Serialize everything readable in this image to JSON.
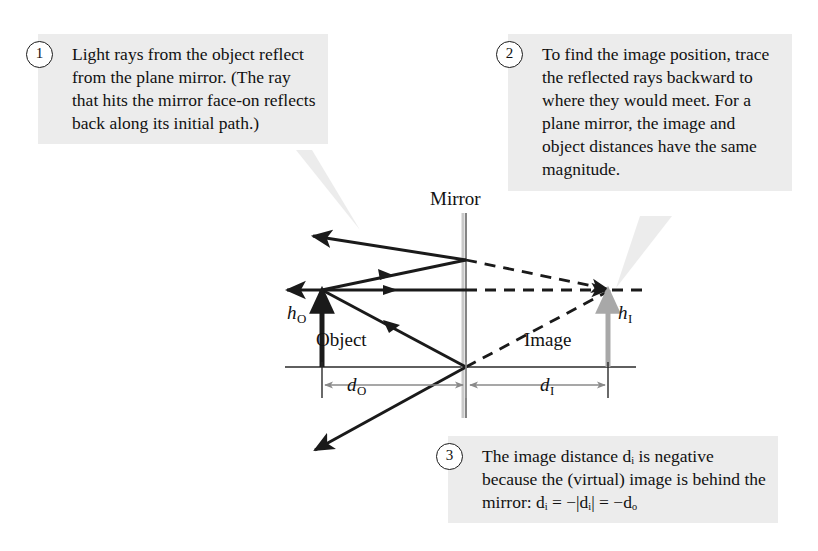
{
  "figure": {
    "title_label": "Mirror",
    "object_label": "Object",
    "image_label": "Image"
  },
  "callouts": [
    {
      "number": "1",
      "text": "Light rays from the object reflect from the plane mirror. (The ray that hits the mirror face-on reflects back along its initial path.)"
    },
    {
      "number": "2",
      "text": "To find the image position, trace the reflected rays backward to where they would meet. For a plane mirror, the image and object distances have the same magnitude."
    },
    {
      "number": "3",
      "text": "The image distance dᵢ is negative because the (virtual) image is behind the mirror: dᵢ = −|dᵢ| = −dₒ"
    }
  ],
  "symbols": {
    "h_object": "h",
    "h_object_sub": "O",
    "h_image": "h",
    "h_image_sub": "I",
    "d_object": "d",
    "d_object_sub": "O",
    "d_image": "d",
    "d_image_sub": "I"
  },
  "callout3_formula": {
    "lead": "the mirror: ",
    "d1": "d",
    "sub1": "I",
    "eq1": " = −|",
    "d2": "d",
    "sub2": "I",
    "eq2": "| = −",
    "d3": "d",
    "sub3": "O"
  },
  "callout3_lines": [
    "The image distance ",
    " is",
    "negative because the",
    "(virtual) image is behind"
  ],
  "colors": {
    "callout_background": "#ececec",
    "ink": "#1a1a1a",
    "mirror_line": "#9a9a9a",
    "axis_line": "#2a2a2a",
    "object_arrow": "#1a1a1a",
    "image_arrow": "#a8a8a8",
    "dimension_line": "#8a8a8a",
    "page_background": "#ffffff"
  },
  "geometry": {
    "mirror_x": 466,
    "axis_y": 367,
    "object_x": 322,
    "object_tip_y": 290,
    "image_x": 608,
    "image_tip_y": 290,
    "axis_left": 285,
    "axis_right": 636
  }
}
